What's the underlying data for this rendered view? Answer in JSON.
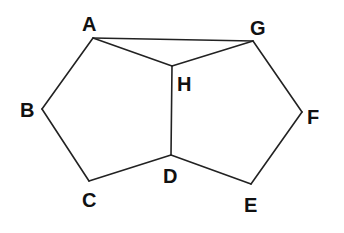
{
  "diagram": {
    "type": "geometry",
    "points": {
      "A": {
        "x": 93,
        "y": 38,
        "lx": 82,
        "ly": 31
      },
      "G": {
        "x": 253,
        "y": 41,
        "lx": 250,
        "ly": 35
      },
      "H": {
        "x": 172,
        "y": 66,
        "lx": 177,
        "ly": 91
      },
      "B": {
        "x": 42,
        "y": 109,
        "lx": 20,
        "ly": 117
      },
      "C": {
        "x": 89,
        "y": 181,
        "lx": 82,
        "ly": 207
      },
      "D": {
        "x": 171,
        "y": 155,
        "lx": 163,
        "ly": 183
      },
      "E": {
        "x": 251,
        "y": 184,
        "lx": 244,
        "ly": 212
      },
      "F": {
        "x": 302,
        "y": 112,
        "lx": 307,
        "ly": 124
      }
    },
    "edges": [
      [
        "A",
        "G"
      ],
      [
        "A",
        "H"
      ],
      [
        "H",
        "G"
      ],
      [
        "H",
        "D"
      ],
      [
        "A",
        "B"
      ],
      [
        "B",
        "C"
      ],
      [
        "C",
        "D"
      ],
      [
        "D",
        "E"
      ],
      [
        "E",
        "F"
      ],
      [
        "F",
        "G"
      ]
    ],
    "labels": {
      "A": "A",
      "B": "B",
      "C": "C",
      "D": "D",
      "E": "E",
      "F": "F",
      "G": "G",
      "H": "H"
    }
  }
}
